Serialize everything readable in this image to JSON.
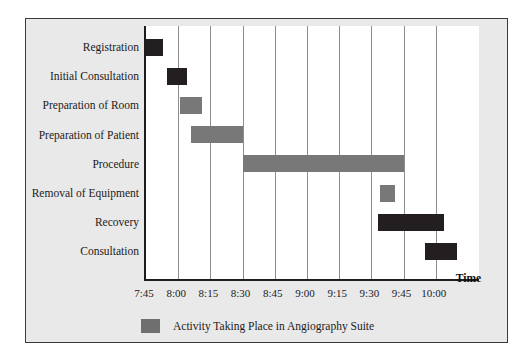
{
  "chart_data": {
    "type": "bar",
    "subtype": "gantt",
    "title": "",
    "xlabel": "Time",
    "ylabel": "",
    "grid": true,
    "legend_position": "bottom-center",
    "x_axis": {
      "ticks": [
        "7:45",
        "8:00",
        "8:15",
        "8:30",
        "8:45",
        "9:00",
        "9:15",
        "9:30",
        "9:45",
        "10:00"
      ],
      "start": "7:45",
      "end": "10:00",
      "interval_minutes": 15
    },
    "categories": [
      "Registration",
      "Initial Consultation",
      "Preparation of Room",
      "Preparation of Patient",
      "Procedure",
      "Removal of Equipment",
      "Recovery",
      "Consultation"
    ],
    "bars": [
      {
        "label": "Registration",
        "start": "7:45",
        "end": "7:53",
        "color": "#231f20",
        "in_suite": false
      },
      {
        "label": "Initial Consultation",
        "start": "7:55",
        "end": "8:04",
        "color": "#231f20",
        "in_suite": false
      },
      {
        "label": "Preparation of Room",
        "start": "8:01",
        "end": "8:11",
        "color": "#787878",
        "in_suite": true
      },
      {
        "label": "Preparation of Patient",
        "start": "8:06",
        "end": "8:30",
        "color": "#787878",
        "in_suite": true
      },
      {
        "label": "Procedure",
        "start": "8:30",
        "end": "9:45",
        "color": "#787878",
        "in_suite": true
      },
      {
        "label": "Removal of Equipment",
        "start": "9:34",
        "end": "9:41",
        "color": "#787878",
        "in_suite": true
      },
      {
        "label": "Recovery",
        "start": "9:33",
        "end": "10:04",
        "color": "#231f20",
        "in_suite": false
      },
      {
        "label": "Consultation",
        "start": "9:55",
        "end": "10:10",
        "color": "#231f20",
        "in_suite": false
      }
    ],
    "legend": [
      {
        "label": "Activity Taking Place in Angiography Suite",
        "color": "#6f6f6f"
      }
    ]
  },
  "colors": {
    "panel_background": "#e9e9e9",
    "plot_background": "#ffffff",
    "axis": "#1d1d1d",
    "gridline": "#8d8d8d",
    "bar_dark": "#231f20",
    "bar_gray": "#787878",
    "text": "#1b1b1b"
  }
}
